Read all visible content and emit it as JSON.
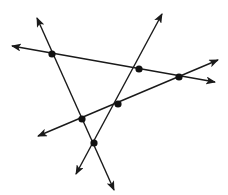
{
  "diagram": {
    "title": "",
    "stroke_color": "#1a1a1a",
    "point_color": "#111111",
    "background": "#ffffff",
    "lines": [
      {
        "id": "line-a",
        "from": [
          37,
          18
        ],
        "to": [
          114,
          190
        ]
      },
      {
        "id": "line-b",
        "from": [
          12,
          46
        ],
        "to": [
          215,
          82
        ]
      },
      {
        "id": "line-c",
        "from": [
          38,
          136
        ],
        "to": [
          218,
          60
        ]
      },
      {
        "id": "line-d",
        "from": [
          76,
          174
        ],
        "to": [
          162,
          14
        ]
      }
    ],
    "points": [
      {
        "id": "p1",
        "x": 52,
        "y": 54,
        "lines": [
          "line-a",
          "line-b"
        ]
      },
      {
        "id": "p2",
        "x": 139,
        "y": 69,
        "lines": [
          "line-b",
          "line-d"
        ]
      },
      {
        "id": "p3",
        "x": 179,
        "y": 77,
        "lines": [
          "line-b",
          "line-c"
        ]
      },
      {
        "id": "p4",
        "x": 118,
        "y": 104,
        "lines": [
          "line-c",
          "line-d"
        ]
      },
      {
        "id": "p5",
        "x": 82,
        "y": 119,
        "lines": [
          "line-a",
          "line-c"
        ]
      },
      {
        "id": "p6",
        "x": 94,
        "y": 143,
        "lines": [
          "line-a",
          "line-d"
        ]
      }
    ]
  }
}
